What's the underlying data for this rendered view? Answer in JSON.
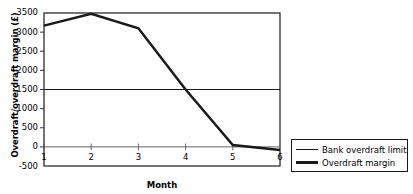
{
  "chart_data": {
    "type": "line",
    "title": "",
    "xlabel": "Month",
    "ylabel": "Overdraft/overdraft margin (£)",
    "categories": [
      "1",
      "2",
      "3",
      "4",
      "5",
      "6"
    ],
    "x": [
      1,
      2,
      3,
      4,
      5,
      6
    ],
    "xlim": [
      1,
      6
    ],
    "ylim": [
      -500,
      3500
    ],
    "ytick_labels": [
      "3500",
      "3000",
      "2500",
      "2000",
      "1500",
      "1000",
      "500",
      "0",
      "-500"
    ],
    "ytick_values": [
      3500,
      3000,
      2500,
      2000,
      1500,
      1000,
      500,
      0,
      -500
    ],
    "ytick_step": 500,
    "grid": false,
    "legend_position": "right",
    "series": [
      {
        "name": "Bank overdraft limit",
        "values": [
          1500,
          1500,
          1500,
          1500,
          1500,
          1500
        ],
        "style": "thin",
        "color": "#1a1a1a"
      },
      {
        "name": "Overdraft margin",
        "values": [
          3170,
          3480,
          3100,
          1500,
          50,
          -80
        ],
        "style": "thick",
        "color": "#1a1a1a"
      }
    ]
  },
  "axes": {
    "y_title": "Overdraft/overdraft margin (£)",
    "x_title": "Month"
  },
  "legend": {
    "entries": [
      {
        "label": "Bank overdraft limit"
      },
      {
        "label": "Overdraft margin"
      }
    ]
  },
  "colors": {
    "line": "#1a1a1a",
    "frame": "#1a1a1a",
    "background": "#ffffff",
    "zero_axis": "#555555"
  }
}
